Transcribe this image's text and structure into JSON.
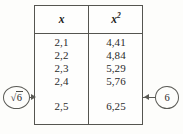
{
  "figure": {
    "type": "math-squares-table",
    "background_color": "#fdfdfb",
    "ink_color": "#2b2b2b",
    "rule_color": "#555550"
  },
  "table": {
    "headers": {
      "col1": "x",
      "col2_base": "x",
      "col2_exponent": "2"
    },
    "rows": [
      {
        "x": "2,1",
        "x2": "4,41"
      },
      {
        "x": "2,2",
        "x2": "4,84"
      },
      {
        "x": "2,3",
        "x2": "5,29"
      },
      {
        "x": "2,4",
        "x2": "5,76"
      },
      {
        "x": "2,5",
        "x2": "6,25"
      }
    ],
    "gap_before_last_row": true
  },
  "annotations": {
    "left": {
      "radical_symbol": "√",
      "radicand": "6",
      "full_label": "√6",
      "arrow_direction": "right",
      "points_to": "x-column"
    },
    "right": {
      "label": "6",
      "arrow_direction": "left",
      "points_to": "x-squared-column"
    }
  }
}
